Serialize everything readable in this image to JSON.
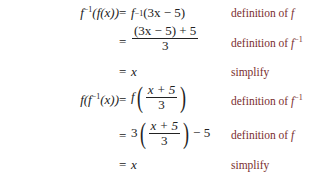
{
  "rows": [
    {
      "lhs_fn": "f",
      "lhs_sup": "−1",
      "lhs_rest": "(f(x))",
      "eq": "=",
      "rhs": {
        "fn": "f",
        "sup": "−1",
        "arg": "(3x − 5)"
      },
      "label_text": "definition of ",
      "label_var": "f",
      "label_sup": ""
    },
    {
      "eq": "=",
      "rhs": {
        "num": "(3x − 5) + 5",
        "den": "3"
      },
      "label_text": "definition of ",
      "label_var": "f",
      "label_sup": "−1"
    },
    {
      "eq": "=",
      "rhs": {
        "text": "x"
      },
      "label_text": "simplify"
    },
    {
      "lhs_a": "f(f",
      "lhs_sup": "−1",
      "lhs_rest": "(x))",
      "eq": "=",
      "rhs": {
        "fn": "f",
        "num": "x + 5",
        "den": "3"
      },
      "label_text": "definition of ",
      "label_var": "f",
      "label_sup": "−1"
    },
    {
      "eq": "=",
      "rhs": {
        "coef": "3",
        "num": "x + 5",
        "den": "3",
        "tail": "− 5"
      },
      "label_text": "definition of ",
      "label_var": "f",
      "label_sup": ""
    },
    {
      "eq": "=",
      "rhs": {
        "text": "x"
      },
      "label_text": "simplify"
    }
  ],
  "colors": {
    "label": "#7a2e2e",
    "math": "#222222"
  }
}
